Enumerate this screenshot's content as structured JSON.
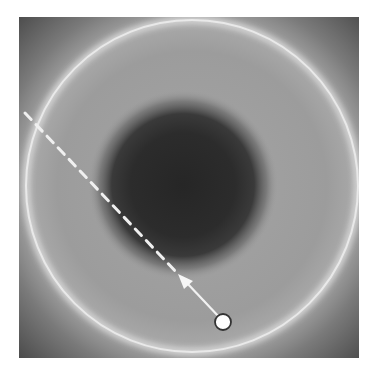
{
  "figure": {
    "colors": {
      "background": "#ffffff",
      "field_mid": "#9a9a9a",
      "field_corner": "#555555",
      "blob_core": "#2a2a2a",
      "ring": "#f2f2f2",
      "line": "#f0f0f0",
      "marker_fill": "#ffffff",
      "marker_stroke": "#333333"
    },
    "blob": {
      "cx": 183,
      "cy": 185,
      "r": 78
    },
    "ring": {
      "cx": 192,
      "cy": 186,
      "r": 165
    },
    "dashed_line": {
      "x1": 25,
      "y1": 113,
      "x2": 178,
      "y2": 274
    },
    "arrow": {
      "from_x": 223,
      "from_y": 322,
      "tip_x": 178,
      "tip_y": 274
    },
    "marker": {
      "cx": 223,
      "cy": 322,
      "r": 8
    }
  }
}
